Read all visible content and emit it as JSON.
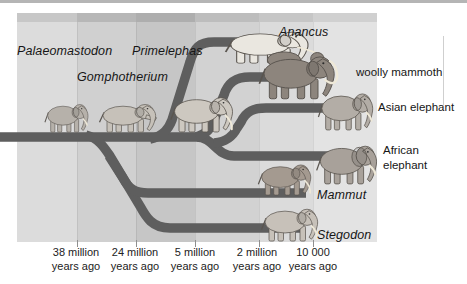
{
  "diagram": {
    "branch_color": "#5e5e5e",
    "labels": {
      "palaeomastodon": "Palaeomastodon",
      "gomphotherium": "Gomphotherium",
      "primelephas": "Primelephas",
      "anancus": "Anancus",
      "woolly_mammoth": "woolly mammoth",
      "asian_elephant": "Asian elephant",
      "african_elephant_line1": "African",
      "african_elephant_line2": "elephant",
      "mammut": "Mammut",
      "stegodon": "Stegodon"
    },
    "timeline": [
      {
        "value": "38 million",
        "unit": "years ago"
      },
      {
        "value": "24 million",
        "unit": "years ago"
      },
      {
        "value": "5 million",
        "unit": "years ago"
      },
      {
        "value": "2 million",
        "unit": "years ago"
      },
      {
        "value": "10 000",
        "unit": "years ago"
      }
    ],
    "animal_icons": [
      "palaeomastodon-illustration",
      "gomphotherium-illustration",
      "primelephas-illustration",
      "anancus-illustration",
      "woolly-mammoth-illustration",
      "asian-elephant-illustration",
      "african-elephant-illustration",
      "mammut-illustration",
      "stegodon-illustration"
    ]
  }
}
